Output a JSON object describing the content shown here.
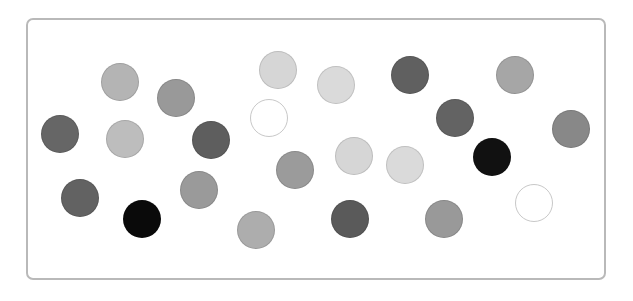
{
  "panel": {
    "border_color": "#b9b9b9",
    "background": "#ffffff"
  },
  "dots": [
    {
      "x": 120,
      "y": 82,
      "r": 19,
      "fill": "#b4b4b4"
    },
    {
      "x": 176,
      "y": 98,
      "r": 19,
      "fill": "#999999"
    },
    {
      "x": 60,
      "y": 134,
      "r": 19,
      "fill": "#666666"
    },
    {
      "x": 125,
      "y": 139,
      "r": 19,
      "fill": "#bdbdbd"
    },
    {
      "x": 211,
      "y": 140,
      "r": 19,
      "fill": "#5e5e5e"
    },
    {
      "x": 80,
      "y": 198,
      "r": 19,
      "fill": "#626262"
    },
    {
      "x": 142,
      "y": 219,
      "r": 19,
      "fill": "#0a0a0a"
    },
    {
      "x": 199,
      "y": 190,
      "r": 19,
      "fill": "#9a9a9a"
    },
    {
      "x": 278,
      "y": 70,
      "r": 19,
      "fill": "#d6d6d6"
    },
    {
      "x": 336,
      "y": 85,
      "r": 19,
      "fill": "#dadada"
    },
    {
      "x": 269,
      "y": 118,
      "r": 19,
      "fill": "#ffffff",
      "outline": true
    },
    {
      "x": 295,
      "y": 170,
      "r": 19,
      "fill": "#9b9b9b"
    },
    {
      "x": 256,
      "y": 230,
      "r": 19,
      "fill": "#adadad"
    },
    {
      "x": 354,
      "y": 156,
      "r": 19,
      "fill": "#d6d6d6"
    },
    {
      "x": 405,
      "y": 165,
      "r": 19,
      "fill": "#dadada"
    },
    {
      "x": 350,
      "y": 219,
      "r": 19,
      "fill": "#5a5a5a"
    },
    {
      "x": 410,
      "y": 75,
      "r": 19,
      "fill": "#606060"
    },
    {
      "x": 455,
      "y": 118,
      "r": 19,
      "fill": "#636363"
    },
    {
      "x": 492,
      "y": 157,
      "r": 19,
      "fill": "#111111"
    },
    {
      "x": 515,
      "y": 75,
      "r": 19,
      "fill": "#a6a6a6"
    },
    {
      "x": 571,
      "y": 129,
      "r": 19,
      "fill": "#888888"
    },
    {
      "x": 444,
      "y": 219,
      "r": 19,
      "fill": "#999999"
    },
    {
      "x": 534,
      "y": 203,
      "r": 19,
      "fill": "#ffffff",
      "outline": true
    }
  ]
}
